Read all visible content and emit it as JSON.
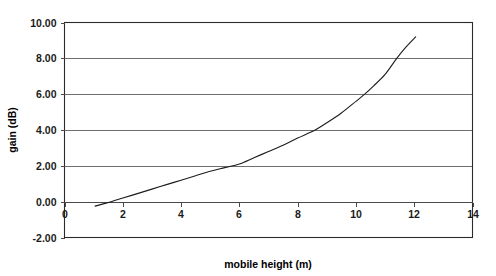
{
  "chart_data": {
    "type": "line",
    "title": "",
    "xlabel": "mobile height (m)",
    "ylabel": "gain (dB)",
    "xlim": [
      0,
      14
    ],
    "ylim": [
      -2.0,
      10.0
    ],
    "xticks": [
      "0",
      "2",
      "4",
      "6",
      "8",
      "10",
      "12",
      "14"
    ],
    "xtick_values": [
      0,
      2,
      4,
      6,
      8,
      10,
      12,
      14
    ],
    "yticks": [
      "-2.00",
      "0.00",
      "2.00",
      "4.00",
      "6.00",
      "8.00",
      "10.00"
    ],
    "ytick_values": [
      -2.0,
      0.0,
      2.0,
      4.0,
      6.0,
      8.0,
      10.0
    ],
    "grid": true,
    "grid_axis": "y",
    "legend": false,
    "legend_position": "none",
    "line_color": "#1c1c1c",
    "axis_color": "#2b2b2b",
    "grid_color": "#6e6e6e",
    "background_color": "#ffffff",
    "series": [
      {
        "name": "gain",
        "x": [
          1.05,
          1.6,
          2.0,
          2.5,
          3.0,
          3.5,
          4.0,
          4.5,
          5.0,
          5.5,
          6.0,
          6.5,
          7.0,
          7.5,
          8.0,
          8.6,
          9.0,
          9.5,
          10.0,
          10.3,
          10.6,
          11.0,
          11.4,
          11.7,
          12.05
        ],
        "y": [
          -0.25,
          0.0,
          0.2,
          0.45,
          0.7,
          0.95,
          1.2,
          1.45,
          1.7,
          1.9,
          2.1,
          2.45,
          2.8,
          3.15,
          3.55,
          4.0,
          4.4,
          4.95,
          5.6,
          6.0,
          6.45,
          7.1,
          8.0,
          8.6,
          9.2
        ]
      }
    ],
    "annotations": []
  }
}
